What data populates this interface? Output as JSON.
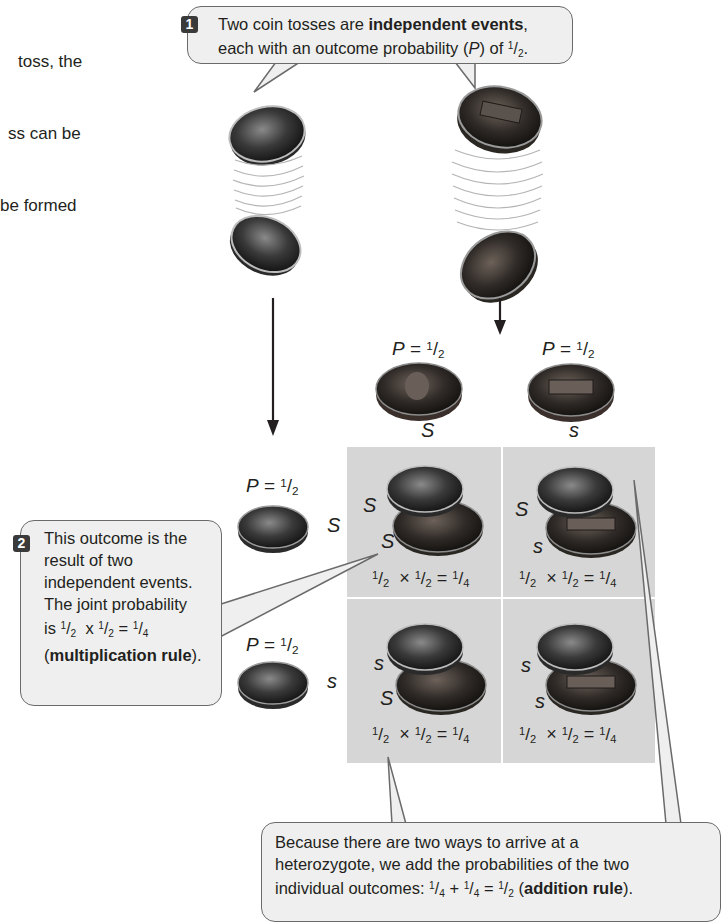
{
  "intro_fragment": [
    "toss, the",
    "ss can be",
    "be formed"
  ],
  "callout1": {
    "step": "1",
    "line1_plain": "Two coin tosses are ",
    "line1_bold": "independent events",
    "line1_end": ",",
    "line2_plain": "each with an outcome probability (",
    "line2_italic": "P",
    "line2_mid": ") of ",
    "line2_frac_num": "1",
    "line2_frac_den": "2",
    "line2_end": "."
  },
  "callout2": {
    "step": "2",
    "lines": [
      "This outcome is the",
      "result of two",
      "independent events.",
      "The joint probability"
    ],
    "line5_prefix": "is ",
    "line5_expr": {
      "a_num": "1",
      "a_den": "2",
      "op": "x",
      "b_num": "1",
      "b_den": "2",
      "eq": "=",
      "c_num": "1",
      "c_den": "4"
    },
    "line6_open": "(",
    "line6_bold": "multiplication rule",
    "line6_close": ")."
  },
  "callout3": {
    "line1": "Because there are two ways to arrive at a",
    "line2": "heterozygote, we add the probabilities of the two",
    "line3_prefix": "individual outcomes: ",
    "expr": {
      "a_num": "1",
      "a_den": "4",
      "op": "+",
      "b_num": "1",
      "b_den": "4",
      "eq": "=",
      "c_num": "1",
      "c_den": "2"
    },
    "line3_open": " (",
    "line3_bold": "addition rule",
    "line3_close": ")."
  },
  "coin_tosses": [
    {
      "coin": "dime",
      "label": "left toss"
    },
    {
      "coin": "penny",
      "label": "right toss"
    }
  ],
  "column_headers": [
    {
      "p_label": "P",
      "p_eq": " = ",
      "num": "1",
      "den": "2",
      "allele": "S",
      "coin": "penny-heads"
    },
    {
      "p_label": "P",
      "p_eq": " = ",
      "num": "1",
      "den": "2",
      "allele": "s",
      "coin": "penny-tails"
    }
  ],
  "row_headers": [
    {
      "p_label": "P",
      "p_eq": " = ",
      "num": "1",
      "den": "2",
      "allele": "S",
      "coin": "dime-heads"
    },
    {
      "p_label": "P",
      "p_eq": " = ",
      "num": "1",
      "den": "2",
      "allele": "s",
      "coin": "dime-tails"
    }
  ],
  "grid": {
    "cells": [
      {
        "top_allele": "S",
        "bottom_allele": "S",
        "expr": {
          "a_num": "1",
          "a_den": "2",
          "op": "×",
          "b_num": "1",
          "b_den": "2",
          "eq": "=",
          "c_num": "1",
          "c_den": "4"
        }
      },
      {
        "top_allele": "S",
        "bottom_allele": "s",
        "expr": {
          "a_num": "1",
          "a_den": "2",
          "op": "×",
          "b_num": "1",
          "b_den": "2",
          "eq": "=",
          "c_num": "1",
          "c_den": "4"
        }
      },
      {
        "top_allele": "s",
        "bottom_allele": "S",
        "expr": {
          "a_num": "1",
          "a_den": "2",
          "op": "×",
          "b_num": "1",
          "b_den": "2",
          "eq": "=",
          "c_num": "1",
          "c_den": "4"
        }
      },
      {
        "top_allele": "s",
        "bottom_allele": "s",
        "expr": {
          "a_num": "1",
          "a_den": "2",
          "op": "×",
          "b_num": "1",
          "b_den": "2",
          "eq": "=",
          "c_num": "1",
          "c_den": "4"
        }
      }
    ]
  },
  "colors": {
    "bubble_fill": "#efefef",
    "bubble_stroke": "#6a6a6a",
    "cell_fill": "#d6d6d6",
    "step_badge": "#3a3a3a",
    "text": "#231f20"
  }
}
